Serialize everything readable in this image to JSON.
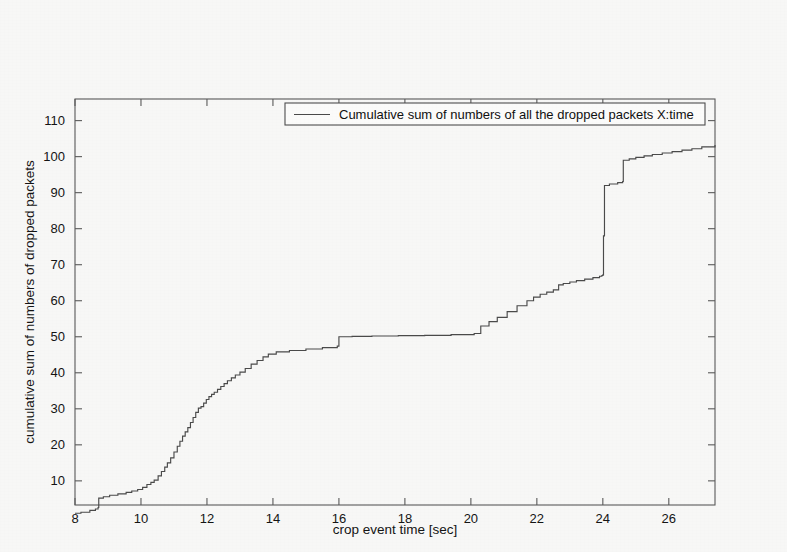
{
  "figure": {
    "background_color": "#f7f7f6",
    "line_color": "#4a4a4a",
    "axis_color": "#5a5a5a"
  },
  "chart_data": {
    "type": "line",
    "title": "",
    "subtitle": "",
    "xlabel": "crop event time [sec]",
    "ylabel": "cumulative sum of numbers of dropped packets",
    "xlim": [
      8,
      27.4
    ],
    "ylim": [
      3.3,
      116
    ],
    "xticks": [
      8,
      10,
      12,
      14,
      16,
      18,
      20,
      22,
      24,
      26
    ],
    "xticklabels": [
      "8",
      "10",
      "12",
      "14",
      "16",
      "18",
      "20",
      "22",
      "24",
      "26"
    ],
    "yticks": [
      10,
      20,
      30,
      40,
      50,
      60,
      70,
      80,
      90,
      100,
      110
    ],
    "yticklabels": [
      "10",
      "20",
      "30",
      "40",
      "50",
      "60",
      "70",
      "80",
      "90",
      "100",
      "110"
    ],
    "grid": false,
    "legend_position": "upper center",
    "series": [
      {
        "name": "Cumulative sum of numbers of all the dropped packets X:time",
        "x": [
          8.0,
          8.18,
          8.45,
          8.62,
          8.7,
          8.72,
          8.86,
          9.05,
          9.3,
          9.55,
          9.72,
          9.9,
          10.05,
          10.18,
          10.3,
          10.4,
          10.52,
          10.62,
          10.72,
          10.8,
          10.9,
          11.0,
          11.1,
          11.18,
          11.26,
          11.34,
          11.42,
          11.5,
          11.58,
          11.66,
          11.74,
          11.82,
          11.9,
          11.98,
          12.06,
          12.14,
          12.22,
          12.32,
          12.42,
          12.52,
          12.62,
          12.74,
          12.86,
          13.0,
          13.16,
          13.34,
          13.52,
          13.7,
          13.86,
          14.1,
          14.5,
          15.0,
          15.5,
          15.95,
          16.0,
          16.4,
          17.0,
          17.8,
          18.6,
          19.4,
          20.1,
          20.3,
          20.55,
          20.8,
          21.1,
          21.4,
          21.7,
          21.9,
          22.1,
          22.3,
          22.5,
          22.66,
          22.8,
          23.0,
          23.2,
          23.45,
          23.7,
          23.9,
          23.97,
          24.0,
          24.02,
          24.05,
          24.2,
          24.45,
          24.6,
          24.62,
          24.8,
          25.0,
          25.25,
          25.5,
          25.8,
          26.1,
          26.4,
          26.7,
          27.0,
          27.4
        ],
        "y": [
          1.0,
          1.3,
          1.8,
          2.2,
          2.6,
          5.2,
          5.6,
          6.0,
          6.4,
          6.8,
          7.2,
          7.6,
          8.2,
          9.0,
          9.6,
          10.2,
          11.4,
          12.6,
          13.8,
          15.0,
          16.4,
          18.0,
          19.6,
          21.0,
          22.4,
          23.6,
          24.8,
          26.2,
          27.6,
          29.0,
          30.2,
          30.6,
          31.6,
          32.6,
          33.4,
          34.0,
          34.6,
          35.4,
          36.2,
          37.0,
          37.8,
          38.6,
          39.4,
          40.2,
          41.2,
          42.4,
          43.4,
          44.4,
          45.2,
          45.8,
          46.2,
          46.6,
          47.0,
          47.4,
          50.0,
          50.1,
          50.2,
          50.3,
          50.4,
          50.6,
          50.9,
          53.0,
          54.2,
          55.4,
          57.0,
          58.6,
          60.0,
          61.0,
          61.8,
          62.4,
          63.0,
          64.4,
          64.8,
          65.2,
          65.6,
          66.0,
          66.4,
          66.8,
          67.0,
          67.2,
          78.0,
          92.0,
          92.4,
          92.8,
          93.1,
          99.0,
          99.4,
          99.8,
          100.2,
          100.6,
          101.0,
          101.4,
          101.8,
          102.2,
          102.7,
          103.2
        ]
      }
    ],
    "annotations": []
  },
  "legend": {
    "entries": [
      {
        "label": "Cumulative sum of numbers of all the dropped packets X:time"
      }
    ]
  }
}
